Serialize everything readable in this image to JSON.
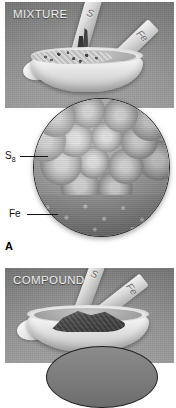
{
  "figure": {
    "panel_letter": "A",
    "panels": [
      {
        "id": "mixture",
        "label": "MIXTURE",
        "spatula_marks": [
          "S",
          "Fe"
        ],
        "description": "Iron filings and sulfur powder being combined in a white evaporating dish"
      },
      {
        "id": "compound",
        "label": "COMPOUND",
        "spatula_marks": [
          "S",
          "Fe"
        ],
        "description": "Dark iron(II) sulfide compound in a white evaporating dish"
      }
    ],
    "magnification": {
      "callouts": [
        {
          "id": "s8",
          "text": "S",
          "subscript": "8"
        },
        {
          "id": "fe",
          "text": "Fe",
          "subscript": ""
        }
      ]
    },
    "colors": {
      "backdrop": "#8d8d8d",
      "label_text": "#efefef",
      "callout_text": "#111111",
      "circle_border": "#2a2a2a",
      "page_background": "#ffffff"
    }
  }
}
